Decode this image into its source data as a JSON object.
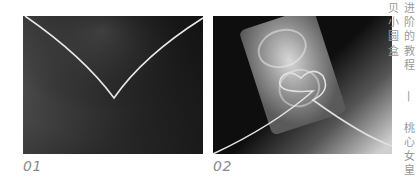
{
  "steps": [
    {
      "number": "01",
      "image": "wire-v-bend-photo"
    },
    {
      "number": "02",
      "image": "heart-wire-on-shell-photo"
    }
  ],
  "sidebar_title": "进阶的教程 | 桃心女皇贝小圆盒",
  "colors": {
    "background": "#ffffff",
    "label_text": "#8a8a8a",
    "title_text": "#9a9a9a"
  }
}
